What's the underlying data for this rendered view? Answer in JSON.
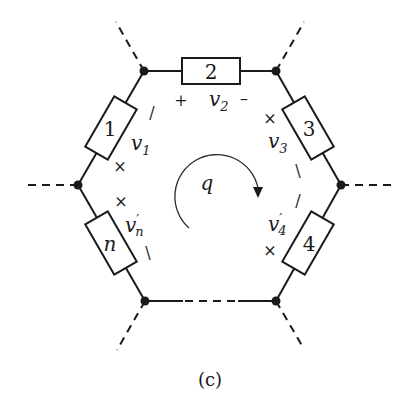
{
  "diagram": {
    "caption": "(c)",
    "loop_label": "q",
    "loop_direction": "clockwise",
    "elements": [
      {
        "id": "1",
        "voltage": "v",
        "subscript": "1",
        "prime": false,
        "plus": "+",
        "minus": "/"
      },
      {
        "id": "2",
        "voltage": "v",
        "subscript": "2",
        "prime": false,
        "plus": "+",
        "minus": "–"
      },
      {
        "id": "3",
        "voltage": "v",
        "subscript": "3",
        "prime": false,
        "plus": "+",
        "minus": "\\"
      },
      {
        "id": "4",
        "voltage": "v",
        "subscript": "4",
        "prime": true,
        "plus": "+",
        "minus": "/"
      },
      {
        "id": "n",
        "voltage": "v",
        "subscript": "n",
        "prime": true,
        "plus": "+",
        "minus": "\\"
      }
    ],
    "missing_branch": "dashed (continuation elements)"
  }
}
